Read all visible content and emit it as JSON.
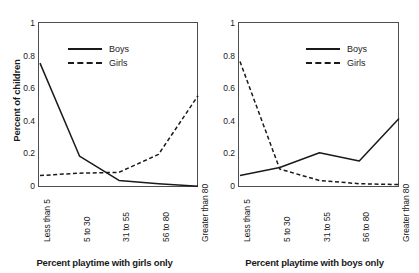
{
  "chart_data": [
    {
      "type": "line",
      "panel": "left",
      "title": "",
      "xlabel": "Percent playtime with girls only",
      "ylabel": "Percent of children",
      "categories": [
        "Less than 5",
        "5 to 30",
        "31 to 55",
        "56 to 80",
        "Greater than 80"
      ],
      "ylim": [
        0,
        1
      ],
      "yticks": [
        0,
        0.2,
        0.4,
        0.6,
        0.8,
        1
      ],
      "ytick_labels": [
        "0",
        "0.2",
        "0.4",
        "0.6",
        "0.8",
        "1"
      ],
      "grid": false,
      "legend_position": "upper center",
      "series": [
        {
          "name": "Boys",
          "style": "solid",
          "color": "#1a1a1a",
          "values": [
            0.76,
            0.19,
            0.04,
            0.02,
            0.005
          ]
        },
        {
          "name": "Girls",
          "style": "dashed",
          "color": "#1a1a1a",
          "values": [
            0.07,
            0.085,
            0.09,
            0.2,
            0.56
          ]
        }
      ]
    },
    {
      "type": "line",
      "panel": "right",
      "title": "",
      "xlabel": "Percent playtime with boys only",
      "ylabel": "",
      "categories": [
        "Less than 5",
        "5 to 30",
        "31 to 55",
        "56 to 80",
        "Greater than 80"
      ],
      "ylim": [
        0,
        1
      ],
      "yticks": [
        0,
        0.2,
        0.4,
        0.6,
        0.8,
        1
      ],
      "ytick_labels": [
        "0",
        "0.2",
        "0.4",
        "0.6",
        "0.8",
        "1"
      ],
      "grid": false,
      "legend_position": "upper center",
      "series": [
        {
          "name": "Boys",
          "style": "solid",
          "color": "#1a1a1a",
          "values": [
            0.07,
            0.12,
            0.21,
            0.16,
            0.42
          ]
        },
        {
          "name": "Girls",
          "style": "dashed",
          "color": "#1a1a1a",
          "values": [
            0.77,
            0.11,
            0.04,
            0.02,
            0.015
          ]
        }
      ]
    }
  ],
  "left_panel": {
    "ylabel": "Percent of children",
    "xlabel": "Percent playtime with girls only",
    "ytick_labels": [
      "1",
      "0.8",
      "0.6",
      "0.4",
      "0.2",
      "0"
    ],
    "xtick_labels": [
      "Less than 5",
      "5 to 30",
      "31 to 55",
      "56 to 80",
      "Greater than 80"
    ],
    "legend": [
      {
        "label": "Boys",
        "style": "solid"
      },
      {
        "label": "Girls",
        "style": "dashed"
      }
    ]
  },
  "right_panel": {
    "ylabel": "",
    "xlabel": "Percent playtime with boys only",
    "ytick_labels": [
      "1",
      "0.8",
      "0.6",
      "0.4",
      "0.2",
      "0"
    ],
    "xtick_labels": [
      "Less than 5",
      "5 to 30",
      "31 to 55",
      "56 to 80",
      "Greater than 80"
    ],
    "legend": [
      {
        "label": "Boys",
        "style": "solid"
      },
      {
        "label": "Girls",
        "style": "dashed"
      }
    ]
  },
  "colors": {
    "line": "#1a1a1a",
    "axis": "#4d4d4d",
    "background": "#ffffff"
  }
}
